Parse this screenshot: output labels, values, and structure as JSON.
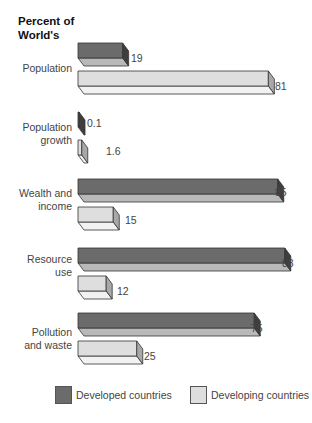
{
  "chart_data": {
    "type": "bar",
    "orientation": "horizontal",
    "title": "Percent of World's",
    "xlabel": "",
    "ylabel": "",
    "xlim": [
      0,
      100
    ],
    "grid": false,
    "legend_position": "bottom",
    "categories": [
      "Population",
      "Population growth",
      "Wealth and income",
      "Resource use",
      "Pollution and waste"
    ],
    "series": [
      {
        "name": "Developed countries",
        "color": "#6b6b6b",
        "values": [
          19,
          0.1,
          85,
          88,
          75
        ]
      },
      {
        "name": "Developing countries",
        "color": "#dcdcdc",
        "values": [
          81,
          1.6,
          15,
          12,
          25
        ]
      }
    ]
  },
  "title": {
    "line1": "Percent of",
    "line2": "World's"
  },
  "labels": {
    "population": [
      "Population"
    ],
    "population_growth": [
      "Population",
      "growth"
    ],
    "wealth": [
      "Wealth and",
      "income"
    ],
    "resource": [
      "Resource",
      "use"
    ],
    "pollution": [
      "Pollution",
      "and waste"
    ]
  },
  "values": {
    "population_dev": "19",
    "population_devg": "81",
    "growth_dev": "0.1",
    "growth_devg": "1.6",
    "wealth_dev": "85",
    "wealth_devg": "15",
    "resource_dev": "88",
    "resource_devg": "12",
    "pollution_dev": "75",
    "pollution_devg": "25"
  },
  "legend": {
    "developed": "Developed countries",
    "developing": "Developing countries"
  },
  "colors": {
    "developed_front": "#6b6b6b",
    "developed_side": "#3e3e3e",
    "developed_bottom": "#b9b9b9",
    "developing_front": "#dedede",
    "developing_side": "#a8a8a8",
    "developing_bottom": "#f2f2f2"
  }
}
